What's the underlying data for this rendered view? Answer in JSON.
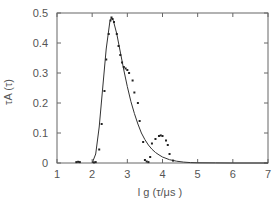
{
  "chart_data": {
    "type": "scatter",
    "title": "",
    "xlabel": "l g (τ/μs )",
    "ylabel": "τA (τ)",
    "xlim": [
      1,
      7
    ],
    "ylim": [
      0,
      0.5
    ],
    "x_ticks": [
      "1",
      "2",
      "3",
      "4",
      "5",
      "6",
      "7"
    ],
    "y_ticks": [
      "0",
      "0.1",
      "0.2",
      "0.3",
      "0.4",
      "0.5"
    ],
    "grid": false,
    "legend": null,
    "series": [
      {
        "name": "measured",
        "style": "points",
        "x": [
          1.55,
          1.6,
          1.65,
          2.05,
          2.1,
          2.2,
          2.27,
          2.35,
          2.4,
          2.47,
          2.52,
          2.55,
          2.58,
          2.62,
          2.7,
          2.75,
          2.8,
          2.85,
          2.9,
          2.95,
          3.0,
          3.05,
          3.15,
          3.2,
          3.3,
          3.35,
          3.45,
          3.5,
          3.55,
          3.6,
          3.65,
          3.7,
          3.8,
          3.9,
          3.95,
          4.0,
          4.1,
          4.15,
          4.2,
          4.3
        ],
        "y": [
          0.003,
          0.004,
          0.003,
          0.002,
          0.003,
          0.045,
          0.13,
          0.24,
          0.345,
          0.43,
          0.475,
          0.485,
          0.48,
          0.47,
          0.43,
          0.39,
          0.36,
          0.335,
          0.32,
          0.315,
          0.31,
          0.3,
          0.275,
          0.235,
          0.2,
          0.14,
          0.07,
          0.01,
          0.005,
          0.003,
          0.02,
          0.065,
          0.08,
          0.09,
          0.092,
          0.09,
          0.075,
          0.06,
          0.03,
          0.008
        ]
      },
      {
        "name": "fit",
        "style": "line",
        "x": [
          2.0,
          2.1,
          2.2,
          2.3,
          2.4,
          2.5,
          2.55,
          2.6,
          2.7,
          2.8,
          2.9,
          3.0,
          3.1,
          3.2,
          3.3,
          3.4,
          3.5,
          3.6,
          3.7,
          3.8,
          3.9,
          4.0,
          4.2,
          4.4,
          4.6,
          4.8,
          5.0,
          5.5,
          6.0,
          7.0
        ],
        "y": [
          0.0,
          0.03,
          0.12,
          0.25,
          0.38,
          0.47,
          0.485,
          0.475,
          0.43,
          0.37,
          0.31,
          0.255,
          0.205,
          0.165,
          0.13,
          0.1,
          0.078,
          0.06,
          0.046,
          0.035,
          0.027,
          0.02,
          0.011,
          0.006,
          0.003,
          0.0015,
          0.0008,
          0.0002,
          0.0,
          0.0
        ]
      }
    ]
  }
}
